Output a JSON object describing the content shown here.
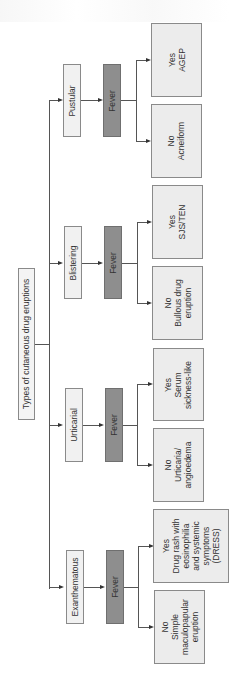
{
  "diagram": {
    "root": {
      "label": "Types of cutaneous drug eruptions"
    },
    "categories": [
      {
        "label": "Pustular",
        "decision": "Fever",
        "outcomes": [
          {
            "answer": "Yes",
            "lines": [
              "AGEP"
            ]
          },
          {
            "answer": "No",
            "lines": [
              "Acneiform"
            ]
          }
        ]
      },
      {
        "label": "Blistering",
        "decision": "Fever",
        "outcomes": [
          {
            "answer": "Yes",
            "lines": [
              "SJS/TEN"
            ]
          },
          {
            "answer": "No",
            "lines": [
              "Bullous drug",
              "eruption"
            ]
          }
        ]
      },
      {
        "label": "Urticarial",
        "decision": "Fever",
        "outcomes": [
          {
            "answer": "Yes",
            "lines": [
              "Serum",
              "sickness-like"
            ]
          },
          {
            "answer": "No",
            "lines": [
              "Urticaria/",
              "angioedema"
            ]
          }
        ]
      },
      {
        "label": "Exanthematous",
        "decision": "Fever",
        "outcomes": [
          {
            "answer": "Yes",
            "lines": [
              "Drug rash with",
              "eosinophilia",
              "and systemic",
              "symptoms",
              "(DRESS)"
            ]
          },
          {
            "answer": "No",
            "lines": [
              "Simple",
              "maculopapular",
              "eruption"
            ]
          }
        ]
      }
    ],
    "colors": {
      "decision_fill": "#8e8e8e",
      "category_fill": "#f1f1f1",
      "outcome_fill": "#ececec",
      "border": "#8a8a8a"
    }
  }
}
